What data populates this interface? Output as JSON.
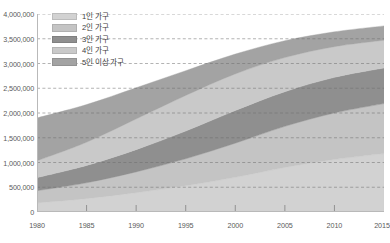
{
  "chart_data": {
    "type": "area",
    "stacked": true,
    "title": "",
    "subtitle": "",
    "xlabel": "",
    "ylabel": "",
    "xlim": [
      1980,
      2015
    ],
    "ylim": [
      0,
      4000000
    ],
    "grid": true,
    "grid_style": "dashed-horizontal",
    "legend_position": "top-left",
    "x_tick_labels": [
      "1980",
      "1985",
      "1990",
      "1995",
      "2000",
      "2005",
      "2010",
      "2015"
    ],
    "x_ticks": [
      1980,
      1985,
      1990,
      1995,
      2000,
      2005,
      2010,
      2015
    ],
    "y_tick_labels": [
      "0",
      "500,000",
      "1,000,000",
      "1,500,000",
      "2,000,000",
      "2,500,000",
      "3,000,000",
      "3,500,000",
      "4,000,000"
    ],
    "y_ticks": [
      0,
      500000,
      1000000,
      1500000,
      2000000,
      2500000,
      3000000,
      3500000,
      4000000
    ],
    "x": [
      1980,
      1985,
      1990,
      1995,
      2000,
      2005,
      2010,
      2015
    ],
    "series": [
      {
        "name": "1인 가구",
        "color": "#d2d2d2",
        "values": [
          185000,
          270000,
          390000,
          530000,
          700000,
          900000,
          1060000,
          1180000
        ]
      },
      {
        "name": "2인 가구",
        "color": "#c4c4c4",
        "values": [
          245000,
          320000,
          420000,
          545000,
          690000,
          830000,
          940000,
          1010000
        ]
      },
      {
        "name": "3인 가구",
        "color": "#8f8f8f",
        "values": [
          265000,
          350000,
          450000,
          560000,
          660000,
          700000,
          720000,
          720000
        ]
      },
      {
        "name": "4인 가구",
        "color": "#c9c9c9",
        "values": [
          340000,
          470000,
          620000,
          720000,
          740000,
          690000,
          620000,
          560000
        ]
      },
      {
        "name": "5인 이상 가구",
        "color": "#a3a3a3",
        "values": [
          865000,
          760000,
          630000,
          500000,
          400000,
          340000,
          300000,
          290000
        ]
      }
    ],
    "totals": [
      1900000,
      2170000,
      2510000,
      2855000,
      3190000,
      3460000,
      3640000,
      3760000
    ]
  },
  "legend": {
    "items": [
      {
        "label": "1인 가구",
        "swatch_name": "legend-swatch-1person"
      },
      {
        "label": "2인 가구",
        "swatch_name": "legend-swatch-2person"
      },
      {
        "label": "3인 가구",
        "swatch_name": "legend-swatch-3person"
      },
      {
        "label": "4인 가구",
        "swatch_name": "legend-swatch-4person"
      },
      {
        "label": "5인 이상 가구",
        "swatch_name": "legend-swatch-5plus"
      }
    ]
  },
  "colors": {
    "background": "#ffffff",
    "axis_line": "#b9b9b9",
    "gridline": "#6f6f6f",
    "tick_text": "#5a5a5a",
    "legend_text": "#3d3d3d"
  }
}
